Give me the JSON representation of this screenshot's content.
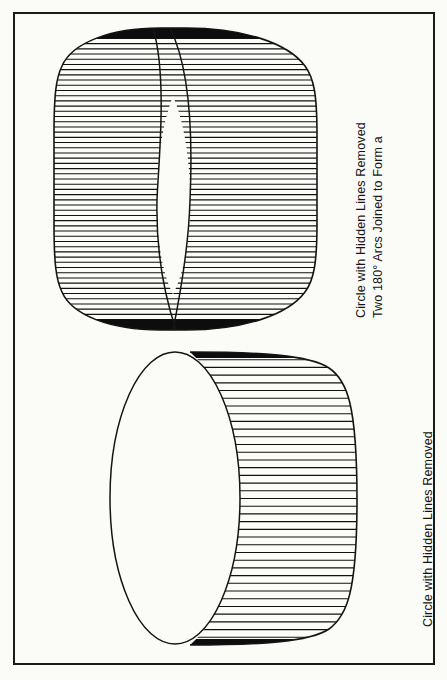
{
  "page": {
    "width": 447,
    "height": 680,
    "background_color": "#fbfbf8",
    "ink_color": "#141414",
    "frame": {
      "border_color": "#1a1a1a",
      "border_width": 2
    }
  },
  "figures": [
    {
      "id": "figure-top",
      "name": "two-arcs-joined-circle",
      "description": "Two 180 degree arcs joined to form a circle, shown as a cylinder-like form filled with dense horizontal hatch lines, with a white lens (vesica) gap where the two arcs cross near the middle",
      "hatch": {
        "orientation": "horizontal",
        "line_count": 58,
        "line_color": "#111111",
        "line_width": 1.1,
        "spacing_px": 5.2
      },
      "bounds": {
        "x": 60,
        "y": 28,
        "width": 253,
        "height": 302
      },
      "caption": {
        "lines": [
          "Two 180° Arcs Joined to Form a",
          "Circle with Hidden Lines Removed"
        ],
        "rotation_deg": -90,
        "font_size_px": 12.5
      }
    },
    {
      "id": "figure-bottom",
      "name": "circle-hidden-lines-removed",
      "description": "A single circle drawn as an ellipse in pictorial view with the right crescent region filled with horizontal hatch lines and the hidden lines removed",
      "hatch": {
        "orientation": "horizontal",
        "line_count": 38,
        "line_color": "#111111",
        "line_width": 1.1,
        "spacing_px": 7.7
      },
      "bounds": {
        "x": 110,
        "y": 352,
        "width": 250,
        "height": 293
      },
      "caption": {
        "lines": [
          "Circle with Hidden Lines Removed"
        ],
        "rotation_deg": -90,
        "font_size_px": 12.5
      }
    }
  ],
  "captions": {
    "top_line1": "Two 180° Arcs Joined to Form a",
    "top_line2": "Circle with Hidden Lines Removed",
    "bottom_line1": "Circle with Hidden Lines Removed"
  }
}
